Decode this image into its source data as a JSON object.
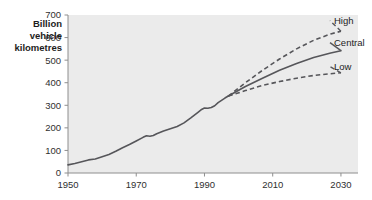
{
  "chart_data": {
    "type": "line",
    "title": "",
    "subtitle": "",
    "ylabel": "Billion vehicle kilometres",
    "ylabel_lines": [
      "Billion",
      "vehicle",
      "kilometres"
    ],
    "xlabel": "",
    "xlim": [
      1950,
      2035
    ],
    "ylim": [
      0,
      700
    ],
    "xticks": [
      1950,
      1970,
      1990,
      2010,
      2030
    ],
    "xtick_labels": [
      "1950",
      "1970",
      "1990",
      "2010",
      "2030"
    ],
    "yticks": [
      0,
      100,
      200,
      300,
      400,
      500,
      600,
      700
    ],
    "ytick_labels": [
      "0",
      "100",
      "200",
      "300",
      "400",
      "500",
      "600",
      "700"
    ],
    "grid": false,
    "legend_position": "right-inline-labels",
    "plot_background": "#ebebeb",
    "line_color": "#56565a",
    "series": [
      {
        "name": "Historical",
        "label": "",
        "style": "solid",
        "x": [
          1950,
          1952,
          1954,
          1956,
          1958,
          1960,
          1962,
          1964,
          1966,
          1968,
          1970,
          1972,
          1973,
          1974,
          1975,
          1976,
          1978,
          1980,
          1982,
          1984,
          1986,
          1988,
          1989,
          1990,
          1991,
          1992,
          1993,
          1994,
          1995,
          1996,
          1997
        ],
        "values": [
          36,
          42,
          50,
          58,
          62,
          72,
          82,
          96,
          112,
          126,
          142,
          158,
          165,
          163,
          166,
          174,
          186,
          196,
          206,
          222,
          244,
          268,
          280,
          288,
          287,
          290,
          298,
          312,
          322,
          332,
          341
        ]
      },
      {
        "name": "High",
        "label": "High",
        "style": "dashed",
        "x": [
          1997,
          2002,
          2007,
          2012,
          2017,
          2022,
          2027,
          2030
        ],
        "values": [
          341,
          400,
          455,
          505,
          550,
          588,
          616,
          628
        ]
      },
      {
        "name": "Central",
        "label": "Central",
        "style": "solid",
        "x": [
          1997,
          2002,
          2007,
          2012,
          2017,
          2022,
          2027,
          2030
        ],
        "values": [
          341,
          383,
          420,
          455,
          485,
          512,
          532,
          542
        ]
      },
      {
        "name": "Low",
        "label": "Low",
        "style": "dashed",
        "x": [
          1997,
          2002,
          2007,
          2012,
          2017,
          2022,
          2027,
          2030
        ],
        "values": [
          341,
          365,
          388,
          405,
          420,
          432,
          440,
          444
        ]
      }
    ]
  }
}
